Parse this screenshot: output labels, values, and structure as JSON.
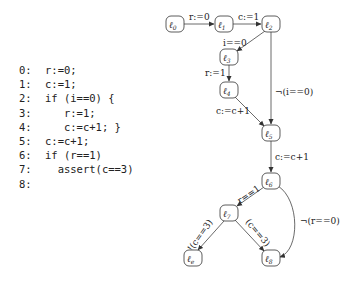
{
  "program": {
    "lines": [
      {
        "num": "0:",
        "code": "r:=0;"
      },
      {
        "num": "1:",
        "code": "c:=1;"
      },
      {
        "num": "2:",
        "code": "if (i==0) {"
      },
      {
        "num": "3:",
        "code": "   r:=1;"
      },
      {
        "num": "4:",
        "code": "   c:=c+1; }"
      },
      {
        "num": "5:",
        "code": "c:=c+1;"
      },
      {
        "num": "6:",
        "code": "if (r==1)"
      },
      {
        "num": "7:",
        "code": "  assert(c==3)"
      },
      {
        "num": "8:",
        "code": ""
      }
    ]
  },
  "cfa": {
    "nodes": [
      {
        "id": "l0",
        "sub": "0"
      },
      {
        "id": "l1",
        "sub": "1"
      },
      {
        "id": "l2",
        "sub": "2"
      },
      {
        "id": "l3",
        "sub": "3"
      },
      {
        "id": "l4",
        "sub": "4"
      },
      {
        "id": "l5",
        "sub": "5"
      },
      {
        "id": "l6",
        "sub": "6"
      },
      {
        "id": "l7",
        "sub": "7"
      },
      {
        "id": "le",
        "sub": "e"
      },
      {
        "id": "l8",
        "sub": "8"
      }
    ],
    "edges": [
      {
        "from": "l0",
        "to": "l1",
        "label": "r:=0"
      },
      {
        "from": "l1",
        "to": "l2",
        "label": "c:=1"
      },
      {
        "from": "l2",
        "to": "l3",
        "label": "i==0"
      },
      {
        "from": "l2",
        "to": "l5",
        "label": "¬(i==0)"
      },
      {
        "from": "l3",
        "to": "l4",
        "label": "r:=1"
      },
      {
        "from": "l4",
        "to": "l5",
        "label": "c:=c+1"
      },
      {
        "from": "l5",
        "to": "l6",
        "label": "c:=c+1"
      },
      {
        "from": "l6",
        "to": "l7",
        "label": "r==1"
      },
      {
        "from": "l6",
        "to": "l8",
        "label": "¬(r==0)"
      },
      {
        "from": "l7",
        "to": "le",
        "label": "!(c==3)"
      },
      {
        "from": "l7",
        "to": "l8",
        "label": "(c==3)"
      }
    ],
    "node_symbol": "ℓ"
  }
}
